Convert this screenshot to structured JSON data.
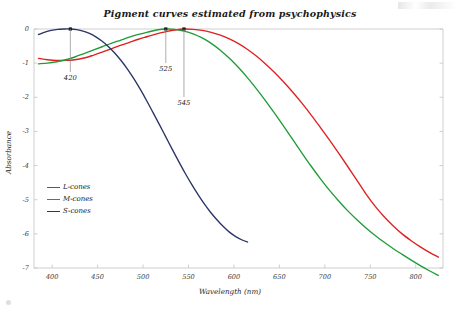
{
  "chart_data": {
    "type": "line",
    "title": "Pigment curves estimated from psychophysics",
    "xlabel": "Wavelength (nm)",
    "ylabel": "Absorbance",
    "xlim": [
      380,
      830
    ],
    "ylim": [
      -7.4,
      0.25
    ],
    "xticks": [
      400,
      450,
      500,
      550,
      600,
      650,
      700,
      750,
      800
    ],
    "yticks": [
      0,
      -1,
      -2,
      -3,
      -4,
      -5,
      -6,
      -7
    ],
    "grid": false,
    "legend_position": "center-left",
    "annotations": [
      {
        "label": "420",
        "wavelength": 420,
        "series": "S-cones",
        "note": "peak"
      },
      {
        "label": "525",
        "wavelength": 525,
        "series": "M-cones",
        "note": "peak"
      },
      {
        "label": "545",
        "wavelength": 545,
        "series": "L-cones",
        "note": "peak"
      }
    ],
    "series": [
      {
        "name": "L-cones",
        "color": "#e02020",
        "peak_nm": 545,
        "x": [
          385,
          395,
          405,
          415,
          425,
          435,
          445,
          455,
          465,
          475,
          485,
          495,
          505,
          515,
          525,
          535,
          545,
          555,
          565,
          575,
          585,
          595,
          605,
          615,
          625,
          635,
          645,
          655,
          665,
          675,
          685,
          695,
          705,
          715,
          725,
          735,
          745,
          755,
          765,
          775,
          785,
          795,
          805,
          815,
          825
        ],
        "y": [
          -0.86,
          -0.9,
          -0.92,
          -0.92,
          -0.9,
          -0.85,
          -0.77,
          -0.68,
          -0.58,
          -0.48,
          -0.39,
          -0.3,
          -0.22,
          -0.14,
          -0.08,
          -0.03,
          0.0,
          -0.01,
          -0.04,
          -0.1,
          -0.18,
          -0.29,
          -0.43,
          -0.6,
          -0.8,
          -1.03,
          -1.28,
          -1.56,
          -1.86,
          -2.18,
          -2.52,
          -2.88,
          -3.25,
          -3.63,
          -4.02,
          -4.42,
          -4.82,
          -5.18,
          -5.49,
          -5.76,
          -6.0,
          -6.2,
          -6.38,
          -6.54,
          -6.68
        ]
      },
      {
        "name": "M-cones",
        "color": "#1f9c38",
        "peak_nm": 525,
        "x": [
          385,
          395,
          405,
          415,
          425,
          435,
          445,
          455,
          465,
          475,
          485,
          495,
          505,
          515,
          525,
          535,
          545,
          555,
          565,
          575,
          585,
          595,
          605,
          615,
          625,
          635,
          645,
          655,
          665,
          675,
          685,
          695,
          705,
          715,
          725,
          735,
          745,
          755,
          765,
          775,
          785,
          795,
          805,
          815,
          825
        ],
        "y": [
          -1.02,
          -1.0,
          -0.96,
          -0.9,
          -0.82,
          -0.72,
          -0.62,
          -0.52,
          -0.42,
          -0.33,
          -0.24,
          -0.16,
          -0.09,
          -0.03,
          0.0,
          -0.01,
          -0.06,
          -0.14,
          -0.26,
          -0.42,
          -0.62,
          -0.86,
          -1.13,
          -1.43,
          -1.76,
          -2.11,
          -2.48,
          -2.86,
          -3.25,
          -3.64,
          -4.02,
          -4.38,
          -4.72,
          -5.03,
          -5.32,
          -5.58,
          -5.82,
          -6.04,
          -6.24,
          -6.43,
          -6.6,
          -6.77,
          -6.93,
          -7.08,
          -7.22
        ]
      },
      {
        "name": "S-cones",
        "color": "#2b3566",
        "peak_nm": 420,
        "x": [
          385,
          392,
          399,
          406,
          413,
          420,
          427,
          434,
          441,
          448,
          455,
          462,
          469,
          476,
          483,
          490,
          497,
          504,
          511,
          518,
          525,
          532,
          539,
          546,
          553,
          560,
          567,
          574,
          581,
          588,
          595,
          602,
          609,
          615
        ],
        "y": [
          -0.16,
          -0.09,
          -0.04,
          -0.01,
          0.0,
          0.0,
          -0.02,
          -0.06,
          -0.13,
          -0.23,
          -0.36,
          -0.52,
          -0.71,
          -0.93,
          -1.18,
          -1.46,
          -1.77,
          -2.1,
          -2.45,
          -2.8,
          -3.16,
          -3.52,
          -3.87,
          -4.21,
          -4.53,
          -4.83,
          -5.11,
          -5.36,
          -5.58,
          -5.78,
          -5.95,
          -6.08,
          -6.18,
          -6.24
        ]
      }
    ]
  },
  "legend": {
    "items": [
      {
        "label": "L-cones",
        "color": "#e02020"
      },
      {
        "label": "M-cones",
        "color": "#1f9c38"
      },
      {
        "label": "S-cones",
        "color": "#2b3566"
      }
    ]
  },
  "axes": {
    "x_title": "Wavelength (nm)",
    "y_title": "Absorbance",
    "x_tick_labels": [
      "400",
      "450",
      "500",
      "550",
      "600",
      "650",
      "700",
      "750",
      "800"
    ],
    "y_tick_labels": [
      "0",
      "-1",
      "-2",
      "-3",
      "-4",
      "-5",
      "-6",
      "-7"
    ]
  },
  "colors": {
    "l_cones": "#e02020",
    "m_cones": "#1f9c38",
    "s_cones": "#2b3566",
    "axis": "#c9c9cc",
    "text": "#1a1a1a",
    "background": "#ffffff"
  }
}
